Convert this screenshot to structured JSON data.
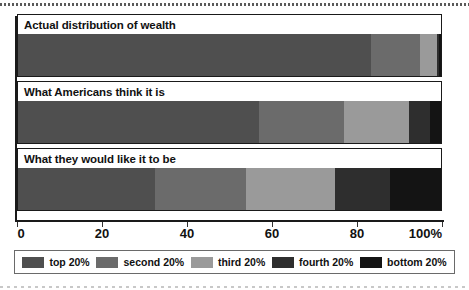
{
  "chart_data": {
    "type": "bar",
    "orientation": "horizontal",
    "stacked": true,
    "title": "",
    "xlabel": "",
    "ylabel": "",
    "xlim": [
      0,
      100
    ],
    "xticks": [
      0,
      20,
      40,
      60,
      80,
      100
    ],
    "xticklabels": [
      "0",
      "20",
      "40",
      "60",
      "80",
      "100%"
    ],
    "grid": false,
    "legend_position": "bottom",
    "categories": [
      "Actual distribution of wealth",
      "What Americans think it is",
      "What they would like it to be"
    ],
    "series": [
      {
        "name": "top 20%",
        "color": "#4f4f4f",
        "values": [
          83.5,
          57.0,
          32.5
        ]
      },
      {
        "name": "second 20%",
        "color": "#6b6b6b",
        "values": [
          11.5,
          20.0,
          21.5
        ]
      },
      {
        "name": "third 20%",
        "color": "#9a9a9a",
        "values": [
          4.0,
          15.5,
          21.0
        ]
      },
      {
        "name": "fourth 20%",
        "color": "#2e2e2e",
        "values": [
          0.6,
          5.0,
          13.0
        ]
      },
      {
        "name": "bottom 20%",
        "color": "#141414",
        "values": [
          0.4,
          2.5,
          12.0
        ]
      }
    ]
  },
  "legend": {
    "items": [
      {
        "label": "top 20%"
      },
      {
        "label": "second 20%"
      },
      {
        "label": "third 20%"
      },
      {
        "label": "fourth 20%"
      },
      {
        "label": "bottom 20%"
      }
    ]
  },
  "axis": {
    "tick_labels": [
      "0",
      "20",
      "40",
      "60",
      "80",
      "100%"
    ]
  },
  "colors": {
    "top": "#4f4f4f",
    "second": "#6b6b6b",
    "third": "#9a9a9a",
    "fourth": "#2e2e2e",
    "bottom": "#141414",
    "axis": "#1a1a1a",
    "text": "#111111"
  }
}
